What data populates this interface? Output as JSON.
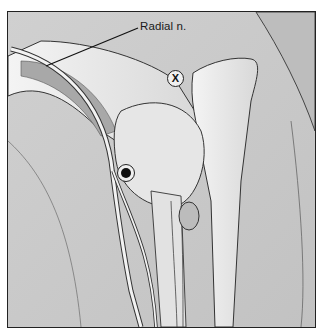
{
  "figure": {
    "labels": {
      "nerve": "Radial n."
    },
    "markers": [
      {
        "type": "x-circle",
        "text": "X",
        "meaning": "incorrect site"
      },
      {
        "type": "filled-dot",
        "text": "",
        "meaning": "injection site"
      }
    ],
    "colors": {
      "background": "#c9c9c9",
      "bone": "#eeeeee",
      "outline": "#222222",
      "border": "#222222"
    }
  }
}
